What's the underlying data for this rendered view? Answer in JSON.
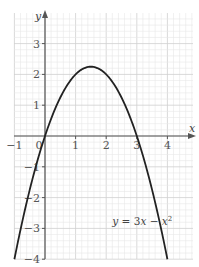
{
  "chart_data": {
    "type": "line",
    "title": "",
    "xlabel": "x",
    "ylabel": "y",
    "xlim": [
      -1,
      4.8
    ],
    "ylim": [
      -4,
      4
    ],
    "grid": true,
    "grid_minor_step": 0.2,
    "x_ticks": [
      -1,
      0,
      1,
      2,
      3,
      4
    ],
    "x_tick_labels": [
      "−1",
      "0",
      "1",
      "2",
      "3",
      "4"
    ],
    "y_ticks": [
      -4,
      -3,
      -2,
      -1,
      1,
      2,
      3
    ],
    "y_tick_labels": [
      "−4",
      "−3",
      "−2",
      "−1",
      "1",
      "2",
      "3"
    ],
    "series": [
      {
        "name": "y = 3x − x²",
        "function": "3x - x^2",
        "x_range": [
          -1,
          4
        ],
        "key_points": [
          {
            "x": -1,
            "y": -4
          },
          {
            "x": 0,
            "y": 0
          },
          {
            "x": 1.5,
            "y": 2.25
          },
          {
            "x": 3,
            "y": 0
          },
          {
            "x": 4,
            "y": -4
          }
        ]
      }
    ],
    "annotation": {
      "text_parts": [
        "y",
        " = 3",
        "x",
        " − ",
        "x",
        "2"
      ],
      "x": 2.2,
      "y": -2.9
    },
    "colors": {
      "curve": "#222222",
      "axis": "#555555",
      "grid_major": "#cfcfcf",
      "grid_minor": "#e8e8e8"
    }
  }
}
